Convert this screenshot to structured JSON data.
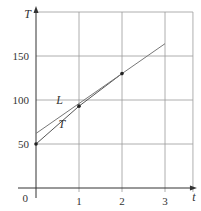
{
  "chart_data": {
    "type": "line",
    "title": "",
    "xlabel": "t",
    "ylabel": "T",
    "xlim": [
      0,
      3.65
    ],
    "ylim": [
      0,
      200
    ],
    "x_ticks": [
      {
        "value": 0,
        "label": "0"
      },
      {
        "value": 1,
        "label": "1"
      },
      {
        "value": 2,
        "label": "2"
      },
      {
        "value": 3,
        "label": "3"
      }
    ],
    "y_ticks": [
      {
        "value": 50,
        "label": "50"
      },
      {
        "value": 100,
        "label": "100"
      },
      {
        "value": 150,
        "label": "150"
      }
    ],
    "grid_x": [
      1,
      2,
      3,
      3.65
    ],
    "grid_y": [
      50,
      100,
      150,
      200
    ],
    "grid": true,
    "series": [
      {
        "name": "T",
        "kind": "polyline-with-points",
        "x": [
          0,
          1,
          2
        ],
        "y": [
          50,
          93,
          130
        ],
        "label_at": {
          "x": 0.6,
          "y": 68
        },
        "color": "#555555"
      },
      {
        "name": "L",
        "kind": "tangent-line",
        "x": [
          0,
          3
        ],
        "y": [
          62,
          164
        ],
        "label_at": {
          "x": 0.55,
          "y": 95
        },
        "color": "#777777"
      }
    ],
    "points": [
      {
        "x": 0,
        "y": 50
      },
      {
        "x": 1,
        "y": 93
      },
      {
        "x": 2,
        "y": 130
      }
    ],
    "origin_label": "0"
  }
}
